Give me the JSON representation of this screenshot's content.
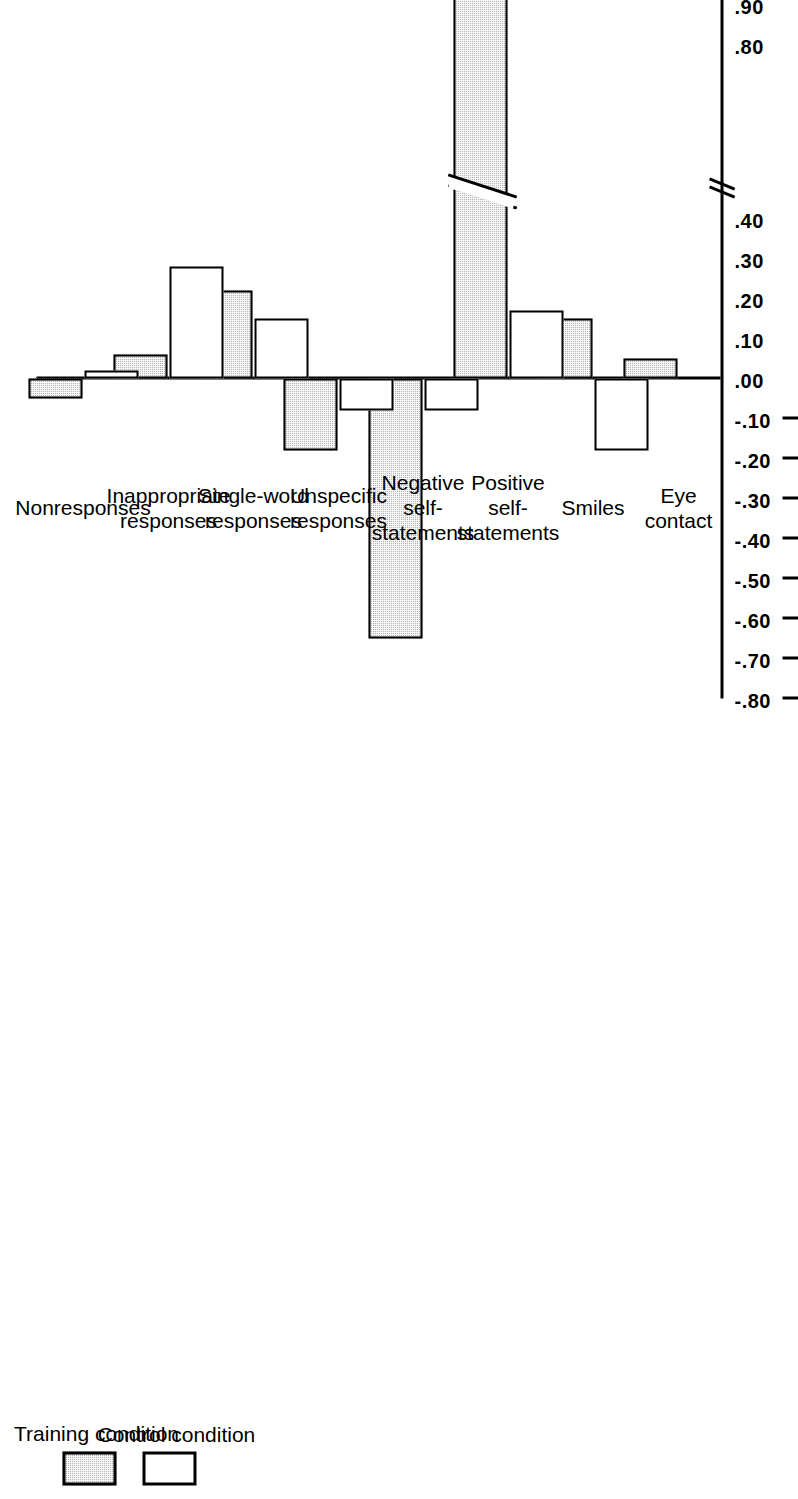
{
  "chart_data": {
    "type": "bar",
    "orientation": "horizontal",
    "title": "",
    "xlabel": "",
    "ylabel": "",
    "grid": false,
    "legend_position": "top-left",
    "axis_break": true,
    "axis_break_between": [
      0.8,
      0.4
    ],
    "tick_labels": [
      "1.10",
      "1.00",
      ".90",
      ".80",
      ".40",
      ".30",
      ".20",
      ".10",
      ".00",
      "-.10",
      "-.20",
      "-.30",
      "-.40",
      "-.50",
      "-.60",
      "-.70",
      "-.80"
    ],
    "tick_values": [
      1.1,
      1.0,
      0.9,
      0.8,
      0.4,
      0.3,
      0.2,
      0.1,
      0.0,
      -0.1,
      -0.2,
      -0.3,
      -0.4,
      -0.5,
      -0.6,
      -0.7,
      -0.8
    ],
    "axis_range": [
      -0.8,
      1.1
    ],
    "categories": [
      "Eye contact",
      "Smiles",
      "Positive self-statements",
      "Negative self-statements",
      "Unspecific responses",
      "Single-word responses",
      "Inappropriate responses",
      "Nonresponses"
    ],
    "category_lines": [
      [
        "Eye",
        "contact"
      ],
      [
        "Smiles"
      ],
      [
        "Positive",
        "self-",
        "statements"
      ],
      [
        "Negative",
        "self-",
        "statements"
      ],
      [
        "Unspecific",
        "responses"
      ],
      [
        "Single-word",
        "responses"
      ],
      [
        "Inappropriate",
        "responses"
      ],
      [
        "Nonresponses"
      ]
    ],
    "series": [
      {
        "name": "Training condition",
        "color": "#b3b3b3",
        "pattern": "dotted-gray",
        "values": [
          0.05,
          0.15,
          1.05,
          -0.65,
          -0.18,
          0.22,
          0.06,
          -0.05
        ]
      },
      {
        "name": "Control condition",
        "color": "#ffffff",
        "pattern": "solid-white",
        "values": [
          0.0,
          -0.18,
          0.17,
          -0.08,
          -0.08,
          0.15,
          0.28,
          0.02
        ]
      }
    ]
  },
  "legend": {
    "items": [
      {
        "label": "Training condition",
        "swatch": "training"
      },
      {
        "label": "Control condition",
        "swatch": "control"
      }
    ]
  }
}
